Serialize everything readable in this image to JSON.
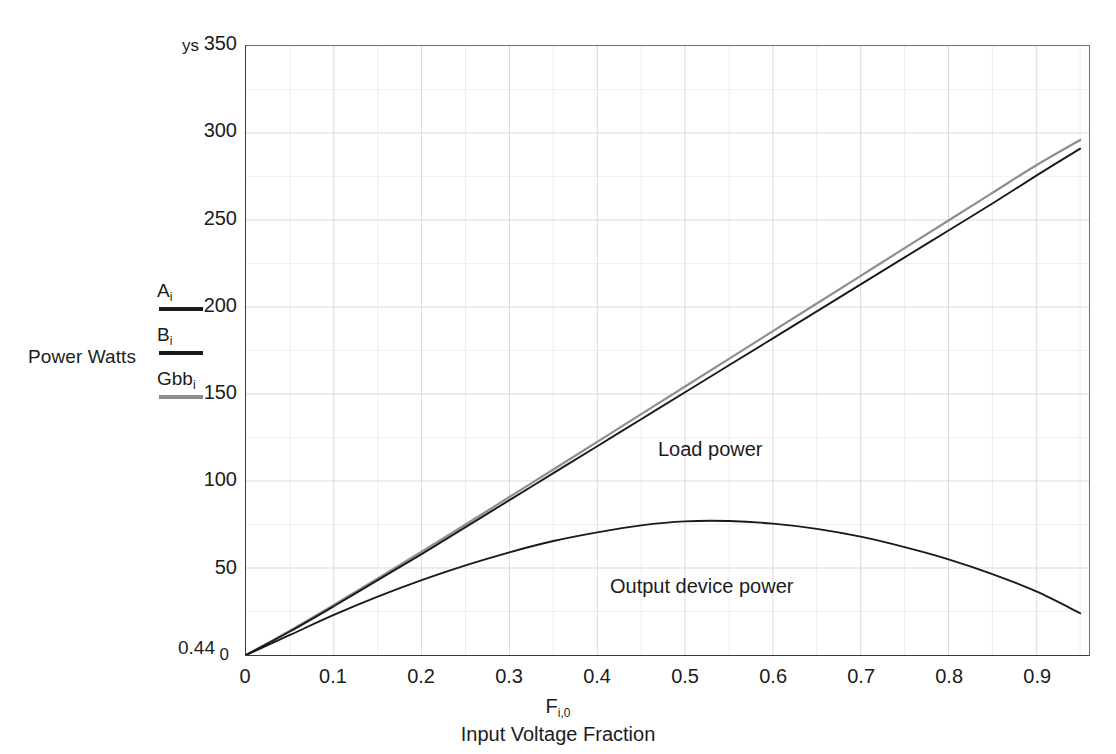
{
  "chart_data": {
    "type": "line",
    "title": "",
    "xlabel": "Input Voltage Fraction",
    "xlabel_symbol": "F",
    "xlabel_symbol_sub": "i,0",
    "ylabel": "Power Watts",
    "y_top_tag": "ys",
    "y_bottom_tag": "0.44",
    "xlim": [
      0,
      0.96
    ],
    "ylim": [
      0,
      350
    ],
    "grid": true,
    "grid_color": "#d8d8d8",
    "legend_position": "left-outside",
    "xticks": [
      "0",
      "0.1",
      "0.2",
      "0.3",
      "0.4",
      "0.5",
      "0.6",
      "0.7",
      "0.8",
      "0.9"
    ],
    "xtick_values": [
      0,
      0.1,
      0.2,
      0.3,
      0.4,
      0.5,
      0.6,
      0.7,
      0.8,
      0.9
    ],
    "yticks": [
      "0",
      "50",
      "100",
      "150",
      "200",
      "250",
      "300",
      "350"
    ],
    "ytick_values": [
      0,
      50,
      100,
      150,
      200,
      250,
      300,
      350
    ],
    "annotations": [
      {
        "text": "Load power",
        "x": 0.47,
        "y": 160
      },
      {
        "text": "Output device power",
        "x": 0.42,
        "y": 40
      }
    ],
    "series": [
      {
        "name": "A",
        "legend": "A",
        "legend_sub": "i",
        "color": "#1a1a1a",
        "label": "Load power",
        "x": [
          0,
          0.05,
          0.1,
          0.15,
          0.2,
          0.25,
          0.3,
          0.35,
          0.4,
          0.45,
          0.5,
          0.55,
          0.6,
          0.65,
          0.7,
          0.75,
          0.8,
          0.85,
          0.9,
          0.95
        ],
        "values": [
          0,
          13.5,
          28.0,
          43.0,
          58.0,
          73.5,
          89.0,
          104.5,
          120.0,
          135.5,
          151.0,
          166.5,
          182.0,
          197.5,
          213.0,
          228.5,
          244.0,
          259.5,
          275.5,
          291.0
        ]
      },
      {
        "name": "B",
        "legend": "B",
        "legend_sub": "i",
        "color": "#1a1a1a",
        "label": "Output device power",
        "x": [
          0,
          0.05,
          0.1,
          0.15,
          0.2,
          0.25,
          0.3,
          0.35,
          0.4,
          0.45,
          0.5,
          0.55,
          0.6,
          0.65,
          0.7,
          0.75,
          0.8,
          0.85,
          0.9,
          0.95
        ],
        "values": [
          0,
          11.5,
          23.0,
          33.5,
          43.0,
          51.5,
          59.0,
          65.5,
          70.5,
          74.5,
          76.8,
          77.0,
          75.5,
          72.5,
          68.0,
          62.0,
          55.0,
          46.5,
          36.5,
          24.0
        ]
      },
      {
        "name": "Gbb",
        "legend": "Gbb",
        "legend_sub": "i",
        "color": "#8e8e8e",
        "label": "Load power (gray)",
        "x": [
          0,
          0.05,
          0.1,
          0.15,
          0.2,
          0.25,
          0.3,
          0.35,
          0.4,
          0.45,
          0.5,
          0.55,
          0.6,
          0.65,
          0.7,
          0.75,
          0.8,
          0.85,
          0.9,
          0.95
        ],
        "values": [
          0,
          14.0,
          28.8,
          44.0,
          59.4,
          75.0,
          90.8,
          106.6,
          122.5,
          138.4,
          154.3,
          170.2,
          186.1,
          202.0,
          217.9,
          233.8,
          249.7,
          265.6,
          281.5,
          296.0
        ]
      }
    ]
  },
  "legend": {
    "entries": [
      {
        "label": "A",
        "sub": "i",
        "swatch": "dark"
      },
      {
        "label": "B",
        "sub": "i",
        "swatch": "dark2"
      },
      {
        "label": "Gbb",
        "sub": "i",
        "swatch": "gray"
      }
    ]
  },
  "axis_labels": {
    "y_title": "Power Watts",
    "ys_tag": "ys",
    "ymin_tag": "0.44",
    "x_symbol": "F",
    "x_symbol_sub": "i,0",
    "x_caption": "Input Voltage Fraction"
  }
}
